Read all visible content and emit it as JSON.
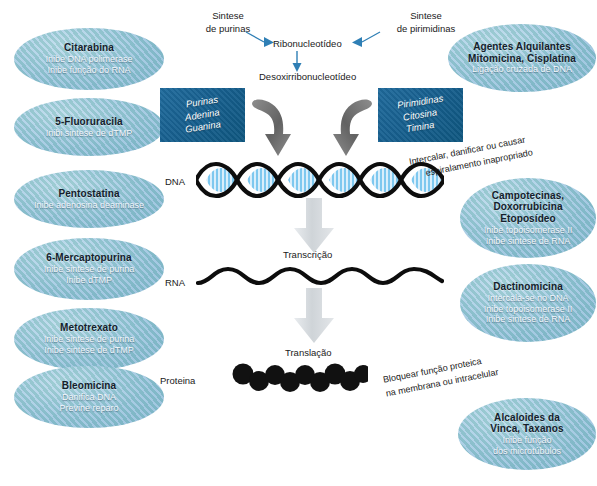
{
  "diagram": {
    "colors": {
      "bubble_blue": "#8fbedd",
      "basebox_blue": "#17608f",
      "arrow_gray": "#c9cdd1",
      "thin_arrow_blue": "#2f7fb5",
      "dna_rung_blue": "#7ec8ef",
      "ink": "#1a1a1a"
    }
  },
  "left_bubbles": [
    {
      "name": "citarabina",
      "title": "Citarabina",
      "lines": [
        "Inibe DNA polimerase",
        "Inibe função do RNA"
      ]
    },
    {
      "name": "fluoruracila",
      "title": "5-Fluoruracila",
      "lines": [
        "Inibi sintese de dTMP"
      ]
    },
    {
      "name": "pentostatina",
      "title": "Pentostatina",
      "lines": [
        "Inibe adenosina deaminase"
      ]
    },
    {
      "name": "mercaptopurina",
      "title": "6-Mercaptopurina",
      "lines": [
        "Inibe sintese de purina",
        "Inibe dTMP"
      ]
    },
    {
      "name": "metotrexato",
      "title": "Metotrexato",
      "lines": [
        "Inibe sintese de purina",
        "Inibe sintese de dTMP"
      ]
    },
    {
      "name": "bleomicina",
      "title": "Bleomicina",
      "lines": [
        "Danifica DNA",
        "Previne reparo"
      ]
    }
  ],
  "right_bubbles": [
    {
      "name": "agentes-alquilantes",
      "title_lines": [
        "Agentes Alquilantes",
        "Mitomicina, Cisplatina"
      ],
      "lines": [
        "Ligação cruzada de DNA"
      ]
    },
    {
      "name": "campotecinas",
      "title_lines": [
        "Campotecinas,",
        "Doxorrubicina",
        "Etoposídeo"
      ],
      "lines": [
        "Inibe topoisomerase II",
        "Inibe sintese de RNA"
      ]
    },
    {
      "name": "dactinomicina",
      "title_lines": [
        "Dactinomicina"
      ],
      "lines": [
        "Intercala-se no DNA",
        "Inibe topoisomerase II",
        "Inibe sintese de RNA"
      ]
    },
    {
      "name": "alcaloides-vinca",
      "title_lines": [
        "Alcaloides da",
        "Vinca, Taxanos"
      ],
      "lines": [
        "Inibe função",
        "dos microtúbulos"
      ]
    }
  ],
  "pathway": {
    "synthesis_purines": [
      "Sintese",
      "de purinas"
    ],
    "synthesis_pyrimidines": [
      "Sintese",
      "de pirimidinas"
    ],
    "ribonucleotide": "Ribonucleotídeo",
    "deoxyribonucleotide": "Desoxirribonucleotídeo",
    "dna_label": "DNA",
    "rna_label": "RNA",
    "protein_label": "Proteina",
    "transcription": "Transcrição",
    "translation": "Translação"
  },
  "base_boxes": [
    {
      "name": "purinas-box",
      "lines": [
        "Purinas",
        "Adenina",
        "Guanina"
      ]
    },
    {
      "name": "pirimidinas-box",
      "lines": [
        "Pirimidinas",
        "Citosina",
        "Timina"
      ]
    }
  ],
  "annotations": [
    {
      "name": "dna-damage-note",
      "lines": [
        "Intercalar, danificar ou causar",
        "espiralamento inapropriado"
      ]
    },
    {
      "name": "protein-block-note",
      "lines": [
        "Bloquear função proteica",
        "na membrana ou intracelular"
      ]
    }
  ]
}
